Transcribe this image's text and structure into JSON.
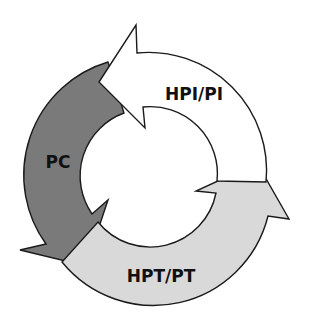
{
  "diagram": {
    "type": "cycle",
    "segments": [
      {
        "label": "HPI/PI",
        "fill": "#ffffff"
      },
      {
        "label": "HPT/PT",
        "fill": "#d9d9d9"
      },
      {
        "label": "PC",
        "fill": "#7a7a7a"
      }
    ],
    "stroke": "#1a1a1a"
  }
}
